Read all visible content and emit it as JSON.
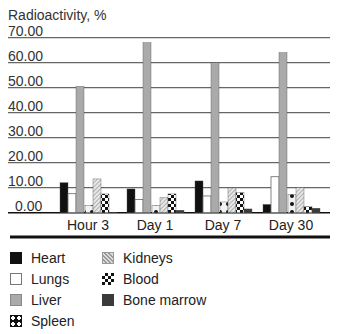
{
  "chart_data": {
    "type": "bar",
    "title": "",
    "ylabel": "Radioactivity, %",
    "xlabel": "",
    "ylim": [
      0,
      70
    ],
    "yticks": [
      "0.00",
      "10.00",
      "20.00",
      "30.00",
      "40.00",
      "50.00",
      "60.00",
      "70.00"
    ],
    "grid": true,
    "legend_position": "bottom",
    "categories": [
      "Hour 3",
      "Day 1",
      "Day 7",
      "Day 30"
    ],
    "series": [
      {
        "name": "Heart",
        "pattern": "solid-black",
        "values": [
          12.0,
          9.5,
          12.7,
          3.3
        ]
      },
      {
        "name": "Lungs",
        "pattern": "white",
        "values": [
          7.6,
          5.3,
          6.7,
          14.4
        ]
      },
      {
        "name": "Liver",
        "pattern": "solid-gray",
        "values": [
          50.5,
          68.0,
          60.0,
          64.0
        ]
      },
      {
        "name": "Spleen",
        "pattern": "black-with-white-dots",
        "values": [
          3.0,
          2.8,
          4.3,
          7.4
        ]
      },
      {
        "name": "Kidneys",
        "pattern": "diagonal-hatch",
        "values": [
          13.5,
          6.0,
          9.9,
          10.0
        ]
      },
      {
        "name": "Blood",
        "pattern": "checkerboard",
        "values": [
          7.5,
          7.5,
          8.0,
          2.4
        ]
      },
      {
        "name": "Bone marrow",
        "pattern": "solid-dark-gray",
        "values": [
          0.2,
          1.0,
          1.5,
          1.8
        ]
      }
    ]
  },
  "legend": {
    "items": [
      {
        "label": "Heart"
      },
      {
        "label": "Lungs"
      },
      {
        "label": "Liver"
      },
      {
        "label": "Spleen"
      },
      {
        "label": "Kidneys"
      },
      {
        "label": "Blood"
      },
      {
        "label": "Bone marrow"
      }
    ]
  },
  "colors": {
    "heart": "#111111",
    "lungs": "#ffffff",
    "liver": "#aaaaaa",
    "bone_marrow": "#3a3a3a",
    "gridline": "#555555",
    "axis": "#111111"
  }
}
